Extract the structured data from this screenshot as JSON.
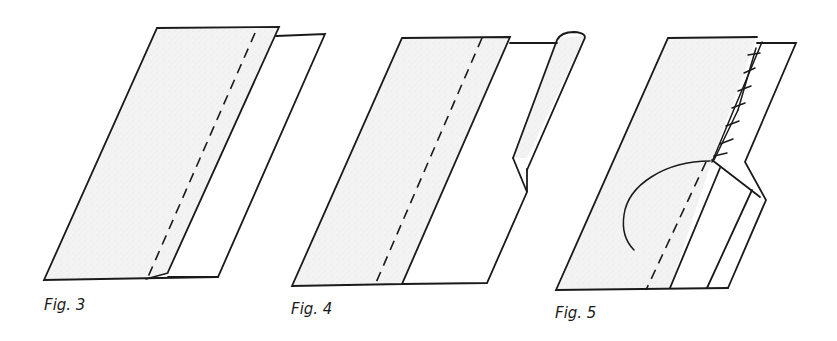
{
  "figures": [
    {
      "id": "fig3",
      "label": "Fig. 3",
      "description": "Two fabric layers; seam stitched (dashed line) along shaded top layer; underlayer extends to the right"
    },
    {
      "id": "fig4",
      "label": "Fig. 4",
      "description": "Seam allowance trimmed; edge of underlayer rolled into a narrow tube at top with a notch in its raw edge"
    },
    {
      "id": "fig5",
      "label": "Fig. 5",
      "description": "Rolled edge slip-stitched down over the seam line; curved thread leading from stitching; folded flap with notch"
    }
  ],
  "colors": {
    "ink": "#1a1a1a",
    "paper": "#ffffff",
    "fabric_shade": "#f2f2f2"
  }
}
